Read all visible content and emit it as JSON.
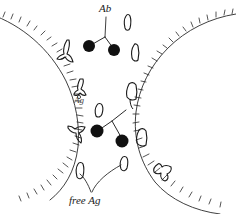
{
  "figure": {
    "type": "hand-drawn biological schematic",
    "background_color": "#ffffff",
    "ink_color": "#1a1a1a",
    "width": 236,
    "height": 214
  },
  "labels": {
    "antibody": "Ab",
    "antigen": "Ag",
    "free_antigen": "free Ag"
  },
  "legend_semantics": {
    "Ab": "antibody, drawn as a Y-shaped molecule",
    "Ag": "antigen, drawn as a small filled black circle",
    "free Ag": "unbound antigen floating in solution, drawn as a small open blob"
  },
  "cells": [
    {
      "name": "left-cell",
      "description": "large cell whose curved membrane enters from upper-left and exits lower-left, receptors as outward ticks",
      "center_x": -40,
      "center_y": 88,
      "radius": 150,
      "receptor_count": 30
    },
    {
      "name": "right-cell",
      "description": "large cell whose curved membrane enters from upper-right and exits lower-right, receptors as outward ticks",
      "center_x": 300,
      "center_y": 95,
      "radius": 165,
      "receptor_count": 28
    }
  ],
  "antibodies": [
    {
      "name": "free-antibody-top",
      "x": 110,
      "y": 22,
      "bound": false,
      "antigen_dots": 2
    },
    {
      "name": "free-antibody-center",
      "x": 110,
      "y": 118,
      "bound": false,
      "antigen_dots": 2
    },
    {
      "name": "membrane-antibody-left-upper",
      "x": 65,
      "y": 52,
      "bound": true
    },
    {
      "name": "membrane-antibody-left-mid",
      "x": 79,
      "y": 88,
      "bound": true
    },
    {
      "name": "membrane-antibody-left-lower",
      "x": 74,
      "y": 136,
      "bound": true
    },
    {
      "name": "membrane-antibody-right-upper",
      "x": 136,
      "y": 53,
      "bound": true
    },
    {
      "name": "membrane-antibody-right-mid",
      "x": 131,
      "y": 93,
      "bound": true
    },
    {
      "name": "membrane-antibody-right-lower",
      "x": 143,
      "y": 139,
      "bound": true
    },
    {
      "name": "membrane-antibody-right-bottom",
      "x": 162,
      "y": 172,
      "bound": true
    }
  ],
  "antigen_dots": [
    {
      "name": "antigen-dot-top-left",
      "x": 89,
      "y": 46,
      "r": 6
    },
    {
      "name": "antigen-dot-top-right",
      "x": 114,
      "y": 50,
      "r": 6
    },
    {
      "name": "antigen-dot-center-left",
      "x": 97,
      "y": 131,
      "r": 6
    },
    {
      "name": "antigen-dot-center-right",
      "x": 122,
      "y": 141,
      "r": 6
    }
  ],
  "free_antigens": [
    {
      "name": "free-antigen-top",
      "x": 128,
      "y": 23
    },
    {
      "name": "free-antigen-mid",
      "x": 99,
      "y": 111
    },
    {
      "name": "free-antigen-lower-left",
      "x": 80,
      "y": 172
    },
    {
      "name": "free-antigen-lower-right",
      "x": 124,
      "y": 165
    }
  ],
  "leader_lines": [
    {
      "name": "leader-ab",
      "from": "Ab label",
      "to": "free-antibody-top"
    },
    {
      "name": "leader-free-ag-left",
      "from": "free Ag label",
      "to": "free-antigen-lower-left"
    },
    {
      "name": "leader-free-ag-right",
      "from": "free Ag label",
      "to": "free-antigen-lower-right"
    }
  ]
}
